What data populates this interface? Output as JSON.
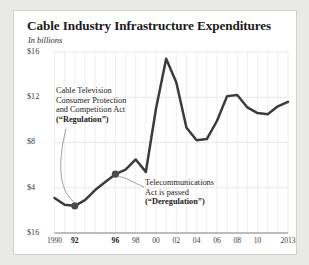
{
  "card": {
    "title": "Cable Industry Infrastructure Expenditures",
    "subtitle": "In billions"
  },
  "annotations": {
    "regulation": {
      "name": "regulation-annotation",
      "lines": [
        "Cable Television",
        "Consumer Protection",
        "and Competition Act",
        "(“Regulation”)"
      ],
      "bold_line_index": 3
    },
    "deregulation": {
      "name": "deregulation-annotation",
      "lines": [
        "Telecommunications",
        "Act is passed",
        "(“Deregulation”)"
      ],
      "bold_line_index": 2
    }
  },
  "chart_data": {
    "type": "line",
    "title": "Cable Industry Infrastructure Expenditures",
    "subtitle": "In billions",
    "xlabel": "",
    "ylabel": "",
    "ylim": [
      0,
      16
    ],
    "xlim": [
      1990,
      2013
    ],
    "grid": true,
    "legend": "none",
    "line_color": "#3b3b3b",
    "marker_color": "#4a4a4a",
    "y_ticks": [
      "$16",
      "$12",
      "$8",
      "$4",
      "$16"
    ],
    "y_tick_values": [
      16,
      12,
      8,
      4,
      0
    ],
    "x_ticks": [
      "1990",
      "92",
      "",
      "96",
      "98",
      "00",
      "02",
      "04",
      "06",
      "08",
      "10",
      "2013"
    ],
    "x_tick_years": [
      1990,
      1992,
      1994,
      1996,
      1998,
      2000,
      2002,
      2004,
      2006,
      2008,
      2010,
      2013
    ],
    "x_tick_bold": [
      false,
      true,
      false,
      true,
      false,
      false,
      false,
      false,
      false,
      false,
      false,
      false
    ],
    "x": [
      1990,
      1991,
      1992,
      1993,
      1994,
      1995,
      1996,
      1997,
      1998,
      1999,
      2000,
      2001,
      2002,
      2003,
      2004,
      2005,
      2006,
      2007,
      2008,
      2009,
      2010,
      2011,
      2012,
      2013
    ],
    "values": [
      3.1,
      2.5,
      2.4,
      2.9,
      3.8,
      4.5,
      5.2,
      5.6,
      6.5,
      5.4,
      11.0,
      15.4,
      13.3,
      9.3,
      8.2,
      8.3,
      9.9,
      12.1,
      12.2,
      11.1,
      10.6,
      10.5,
      11.2,
      11.6
    ],
    "markers": [
      {
        "year": 1992,
        "value": 2.4,
        "label": "regulation-marker"
      },
      {
        "year": 1996,
        "value": 5.2,
        "label": "deregulation-marker"
      }
    ]
  }
}
